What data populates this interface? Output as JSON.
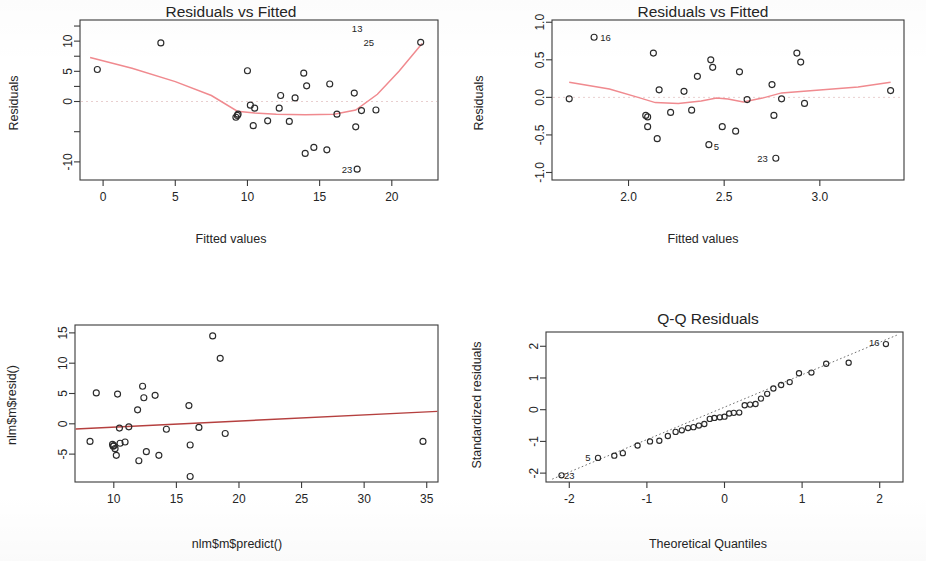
{
  "figure": {
    "background": "#ffffff",
    "point_color": "#2b2b2b",
    "loess_color": "#f08a8f",
    "lm_color": "#b5403f",
    "qqline_color": "#707070"
  },
  "panels": [
    {
      "key": "residuals_vs_fitted_1",
      "title": "Residuals vs Fitted",
      "xlabel": "Fitted values",
      "ylabel": "Residuals"
    },
    {
      "key": "residuals_vs_fitted_2",
      "title": "Residuals vs Fitted",
      "xlabel": "Fitted values",
      "ylabel": "Residuals"
    },
    {
      "key": "resid_vs_predict",
      "title": "",
      "xlabel": "nlm$m$predict()",
      "ylabel": "nlm$m$resid()"
    },
    {
      "key": "qq_residuals",
      "title": "Q-Q Residuals",
      "xlabel": "Theoretical Quantiles",
      "ylabel": "Standardized residuals"
    }
  ],
  "chart_data": [
    {
      "type": "scatter",
      "key": "residuals_vs_fitted_1",
      "title": "Residuals vs Fitted",
      "xlabel": "Fitted values",
      "ylabel": "Residuals",
      "xlim": [
        -1.6,
        23.2
      ],
      "ylim": [
        -13.0,
        13.5
      ],
      "xticks": [
        0,
        5,
        10,
        15,
        20
      ],
      "yticks": [
        -10,
        0,
        5,
        10
      ],
      "ytick_labels": [
        "-10",
        "0",
        "5",
        "10"
      ],
      "grid": false,
      "legend": "none",
      "zero_reference_line": 0,
      "points": [
        [
          -0.4,
          5.3
        ],
        [
          4.0,
          9.7
        ],
        [
          9.2,
          -2.6
        ],
        [
          9.3,
          -2.3
        ],
        [
          9.35,
          -2.1
        ],
        [
          10.0,
          5.1
        ],
        [
          10.2,
          -0.6
        ],
        [
          10.4,
          -4.0
        ],
        [
          10.5,
          -1.1
        ],
        [
          11.4,
          -3.2
        ],
        [
          12.2,
          -1.1
        ],
        [
          12.3,
          1.0
        ],
        [
          12.9,
          -3.3
        ],
        [
          13.3,
          0.6
        ],
        [
          13.9,
          4.7
        ],
        [
          14.0,
          -8.6
        ],
        [
          14.1,
          2.6
        ],
        [
          14.6,
          -7.6
        ],
        [
          15.5,
          -8.0
        ],
        [
          15.7,
          2.9
        ],
        [
          16.2,
          -2.1
        ],
        [
          17.4,
          1.4
        ],
        [
          17.5,
          -4.2
        ],
        [
          17.6,
          -11.2
        ],
        [
          17.9,
          -1.5
        ],
        [
          18.9,
          -1.4
        ],
        [
          22.0,
          9.8
        ]
      ],
      "loess_curve": [
        [
          -0.9,
          7.3
        ],
        [
          2.0,
          5.5
        ],
        [
          5.0,
          3.3
        ],
        [
          7.5,
          1.0
        ],
        [
          9.3,
          -1.6
        ],
        [
          10.5,
          -1.9
        ],
        [
          12.0,
          -2.1
        ],
        [
          14.0,
          -2.2
        ],
        [
          16.0,
          -2.1
        ],
        [
          17.5,
          -1.4
        ],
        [
          19.0,
          1.2
        ],
        [
          20.5,
          5.0
        ],
        [
          22.1,
          9.6
        ]
      ],
      "annotations": [
        {
          "label": "13",
          "x": 17.6,
          "y": 12.0
        },
        {
          "label": "25",
          "x": 18.4,
          "y": 9.8
        },
        {
          "label": "23",
          "x": 16.9,
          "y": -11.2
        }
      ]
    },
    {
      "type": "scatter",
      "key": "residuals_vs_fitted_2",
      "title": "Residuals vs Fitted",
      "xlabel": "Fitted values",
      "ylabel": "Residuals",
      "xlim": [
        1.6,
        3.44
      ],
      "ylim": [
        -1.1,
        1.03
      ],
      "xticks": [
        2.0,
        2.5,
        3.0
      ],
      "xtick_labels": [
        "2.0",
        "2.5",
        "3.0"
      ],
      "yticks": [
        -1.0,
        -0.5,
        0.0,
        0.5,
        1.0
      ],
      "ytick_labels": [
        "-1.0",
        "-0.5",
        "0.0",
        "0.5",
        "1.0"
      ],
      "grid": false,
      "legend": "none",
      "zero_reference_line": 0,
      "points": [
        [
          1.69,
          -0.02
        ],
        [
          1.82,
          0.8
        ],
        [
          2.09,
          -0.24
        ],
        [
          2.1,
          -0.26
        ],
        [
          2.1,
          -0.39
        ],
        [
          2.13,
          0.59
        ],
        [
          2.15,
          -0.55
        ],
        [
          2.16,
          0.1
        ],
        [
          2.22,
          -0.2
        ],
        [
          2.29,
          0.08
        ],
        [
          2.33,
          -0.17
        ],
        [
          2.36,
          0.28
        ],
        [
          2.42,
          -0.63
        ],
        [
          2.43,
          0.5
        ],
        [
          2.44,
          0.4
        ],
        [
          2.49,
          -0.39
        ],
        [
          2.56,
          -0.45
        ],
        [
          2.58,
          0.34
        ],
        [
          2.62,
          -0.03
        ],
        [
          2.75,
          0.17
        ],
        [
          2.76,
          -0.24
        ],
        [
          2.77,
          -0.81
        ],
        [
          2.8,
          -0.02
        ],
        [
          2.88,
          0.59
        ],
        [
          2.9,
          0.47
        ],
        [
          2.92,
          -0.08
        ],
        [
          3.37,
          0.09
        ]
      ],
      "loess_curve": [
        [
          1.69,
          0.2
        ],
        [
          1.9,
          0.11
        ],
        [
          2.05,
          0.0
        ],
        [
          2.14,
          -0.07
        ],
        [
          2.26,
          -0.08
        ],
        [
          2.38,
          -0.05
        ],
        [
          2.46,
          -0.01
        ],
        [
          2.52,
          -0.02
        ],
        [
          2.6,
          -0.06
        ],
        [
          2.7,
          -0.01
        ],
        [
          2.8,
          0.06
        ],
        [
          3.0,
          0.1
        ],
        [
          3.2,
          0.14
        ],
        [
          3.37,
          0.2
        ]
      ],
      "annotations": [
        {
          "label": "16",
          "x": 1.88,
          "y": 0.8
        },
        {
          "label": "5",
          "x": 2.46,
          "y": -0.65
        },
        {
          "label": "23",
          "x": 2.7,
          "y": -0.81
        }
      ]
    },
    {
      "type": "scatter",
      "key": "resid_vs_predict",
      "title": "",
      "xlabel": "nlm$m$predict()",
      "ylabel": "nlm$m$resid()",
      "xlim": [
        6.9,
        35.9
      ],
      "ylim": [
        -9.6,
        16.3
      ],
      "xticks": [
        10,
        15,
        20,
        25,
        30,
        35
      ],
      "yticks": [
        -5,
        0,
        5,
        10,
        15
      ],
      "grid": false,
      "legend": "none",
      "points": [
        [
          8.1,
          -2.9
        ],
        [
          8.6,
          5.1
        ],
        [
          9.9,
          -3.4
        ],
        [
          9.95,
          -3.7
        ],
        [
          10.0,
          -3.6
        ],
        [
          10.1,
          -4.1
        ],
        [
          10.2,
          -5.2
        ],
        [
          10.3,
          4.9
        ],
        [
          10.45,
          -0.7
        ],
        [
          10.5,
          -3.2
        ],
        [
          10.9,
          -3.0
        ],
        [
          11.2,
          -0.5
        ],
        [
          11.9,
          2.3
        ],
        [
          12.0,
          -6.1
        ],
        [
          12.3,
          6.2
        ],
        [
          12.4,
          4.3
        ],
        [
          12.6,
          -4.6
        ],
        [
          13.3,
          4.7
        ],
        [
          13.6,
          -5.2
        ],
        [
          14.2,
          -0.9
        ],
        [
          16.0,
          3.0
        ],
        [
          16.1,
          -3.5
        ],
        [
          16.1,
          -8.7
        ],
        [
          16.8,
          -0.6
        ],
        [
          17.9,
          14.5
        ],
        [
          18.5,
          10.8
        ],
        [
          18.9,
          -1.6
        ],
        [
          34.7,
          -2.9
        ]
      ],
      "fit_line": {
        "x": [
          6.95,
          35.85
        ],
        "y": [
          -0.85,
          2.05
        ]
      },
      "annotations": []
    },
    {
      "type": "scatter",
      "key": "qq_residuals",
      "title": "Q-Q Residuals",
      "xlabel": "Theoretical Quantiles",
      "ylabel": "Standardized residuals",
      "xlim": [
        -2.3,
        2.3
      ],
      "ylim": [
        -2.28,
        2.45
      ],
      "xticks": [
        -2,
        -1,
        0,
        1,
        2
      ],
      "yticks": [
        -2,
        -1,
        0,
        1,
        2
      ],
      "grid": false,
      "legend": "none",
      "points": [
        [
          -2.1,
          -2.07
        ],
        [
          -1.63,
          -1.52
        ],
        [
          -1.42,
          -1.45
        ],
        [
          -1.31,
          -1.37
        ],
        [
          -1.12,
          -1.13
        ],
        [
          -0.96,
          -1.0
        ],
        [
          -0.84,
          -0.98
        ],
        [
          -0.73,
          -0.83
        ],
        [
          -0.63,
          -0.7
        ],
        [
          -0.55,
          -0.65
        ],
        [
          -0.47,
          -0.58
        ],
        [
          -0.4,
          -0.55
        ],
        [
          -0.33,
          -0.5
        ],
        [
          -0.26,
          -0.45
        ],
        [
          -0.19,
          -0.29
        ],
        [
          -0.13,
          -0.26
        ],
        [
          -0.06,
          -0.24
        ],
        [
          0.0,
          -0.22
        ],
        [
          0.06,
          -0.12
        ],
        [
          0.12,
          -0.1
        ],
        [
          0.19,
          -0.09
        ],
        [
          0.26,
          0.14
        ],
        [
          0.33,
          0.16
        ],
        [
          0.4,
          0.18
        ],
        [
          0.47,
          0.35
        ],
        [
          0.55,
          0.5
        ],
        [
          0.63,
          0.67
        ],
        [
          0.73,
          0.78
        ],
        [
          0.84,
          0.87
        ],
        [
          0.96,
          1.15
        ],
        [
          1.12,
          1.17
        ],
        [
          1.31,
          1.45
        ],
        [
          1.6,
          1.48
        ],
        [
          2.08,
          2.07
        ]
      ],
      "reference_line": {
        "x": [
          -2.22,
          2.22
        ],
        "y": [
          -2.19,
          2.35
        ]
      },
      "annotations": [
        {
          "label": "23",
          "x": -2.0,
          "y": -2.07
        },
        {
          "label": "16",
          "x": 1.93,
          "y": 2.1
        },
        {
          "label": "5",
          "x": -1.76,
          "y": -1.52
        }
      ]
    }
  ]
}
